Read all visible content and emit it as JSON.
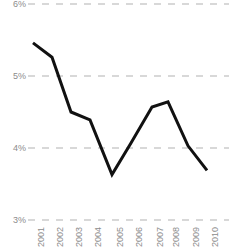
{
  "chart_data": {
    "type": "line",
    "title": "",
    "subtitle": "",
    "xlabel": "",
    "ylabel": "",
    "categories": [
      "2001",
      "2002",
      "2003",
      "2004",
      "2005",
      "2006",
      "2007",
      "2008",
      "2009",
      "2010"
    ],
    "values": [
      5.46,
      5.26,
      4.5,
      4.39,
      3.63,
      4.07,
      4.57,
      4.64,
      4.03,
      3.69
    ],
    "series": [
      {
        "name": "",
        "values": [
          5.46,
          5.26,
          4.5,
          4.39,
          3.63,
          4.07,
          4.57,
          4.64,
          4.03,
          3.69
        ]
      }
    ],
    "ylim": [
      3,
      6
    ],
    "ytick_values": [
      6,
      5,
      4,
      3
    ],
    "ytick_labels": [
      "6%",
      "5%",
      "4%",
      "3%"
    ],
    "xtick_labels": [
      "2001",
      "2002",
      "2003",
      "2004",
      "2005",
      "2006",
      "2007",
      "2008",
      "2009",
      "2010"
    ],
    "grid": true,
    "grid_axis": "y",
    "grid_style": "dashed",
    "grid_color": "#cccccc",
    "line_color": "#111111",
    "line_width": 3,
    "legend": false,
    "legend_position": "none",
    "annotations": [],
    "axis_label_color": "#8c8c8c",
    "background_color": "#ffffff"
  },
  "geometry": {
    "width": 231,
    "height": 249,
    "plot_left": 33,
    "plot_right": 207,
    "y_for_6": 4,
    "y_for_5": 76,
    "y_for_4": 148,
    "y_for_3": 220,
    "px_per_percent": 72,
    "x_positions": [
      33,
      52,
      71,
      90,
      112,
      131,
      152,
      168,
      188,
      207
    ],
    "y_label_x": 2,
    "x_label_top": 224
  }
}
